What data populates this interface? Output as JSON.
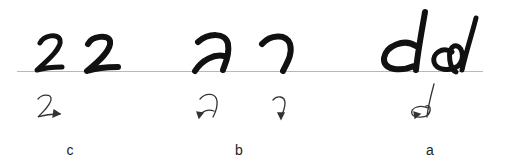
{
  "figure": {
    "baseline_color": "#b8b8b8",
    "ink_color": "#111111",
    "panels": [
      {
        "label": "c",
        "character": "2",
        "glyph_count": 2,
        "sketch": "2 with arrow at stroke end"
      },
      {
        "label": "b",
        "character": "Thai-like hook glyph",
        "glyph_count": 2,
        "sketch": "hook strokes with downward arrows"
      },
      {
        "label": "a",
        "character": "d",
        "glyph_count": 2,
        "sketch": "d loop with arrow and ascender"
      }
    ]
  }
}
